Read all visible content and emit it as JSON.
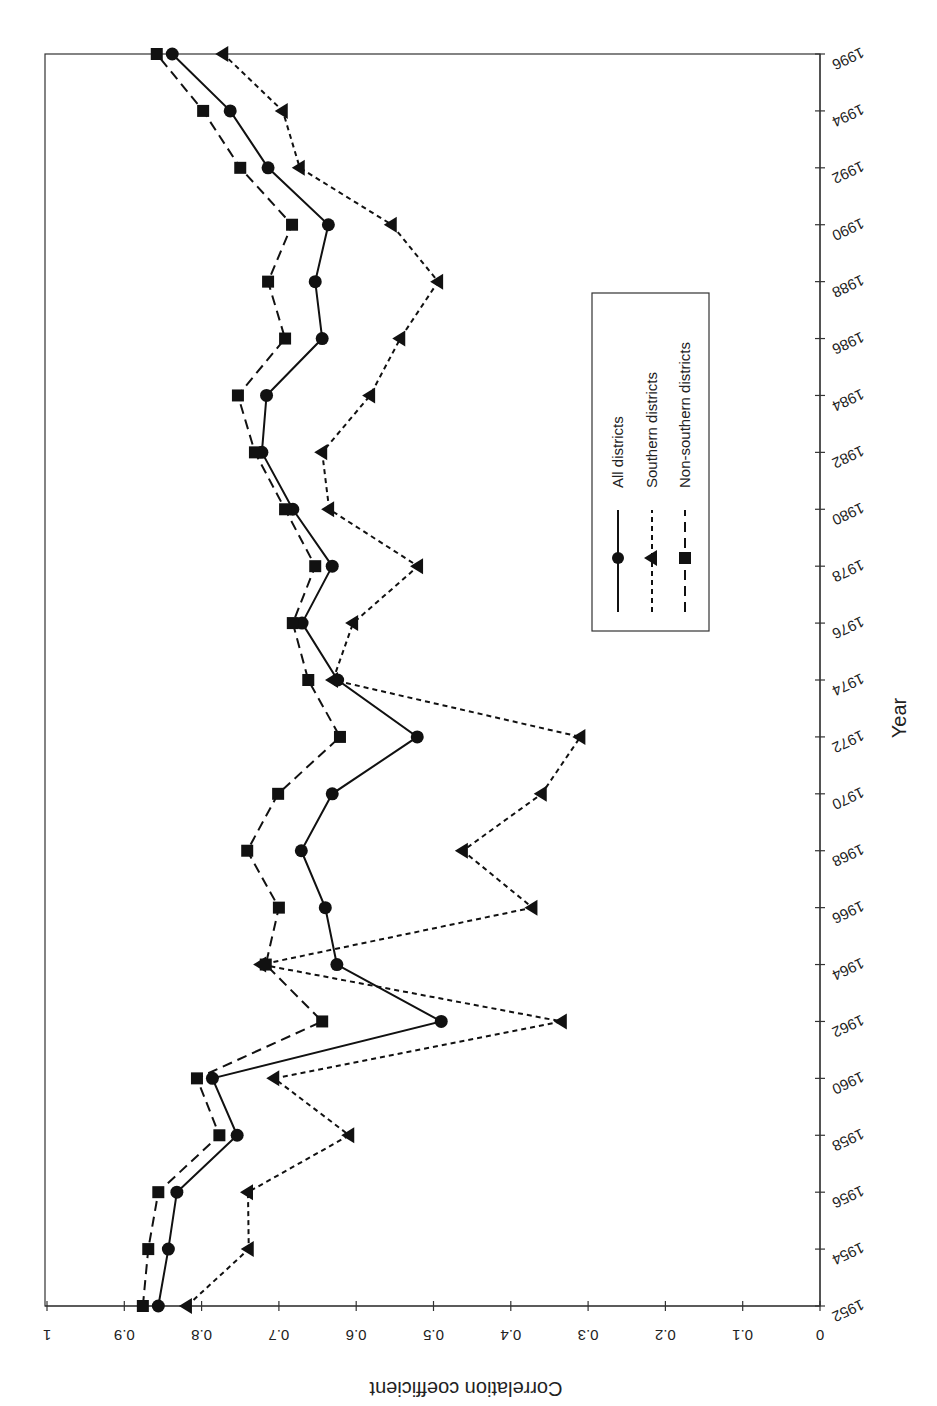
{
  "chart_data": {
    "type": "line",
    "orientation_note": "rotated 90 degrees clockwise on page",
    "title": "",
    "xlabel": "Year",
    "ylabel": "Correlation coefficient",
    "x": [
      1952,
      1954,
      1956,
      1958,
      1960,
      1962,
      1964,
      1966,
      1968,
      1970,
      1972,
      1974,
      1976,
      1978,
      1980,
      1982,
      1984,
      1986,
      1988,
      1990,
      1992,
      1994,
      1996
    ],
    "x_ticks": [
      "1952",
      "1954",
      "1956",
      "1958",
      "1960",
      "1962",
      "1964",
      "1966",
      "1968",
      "1970",
      "1972",
      "1974",
      "1976",
      "1978",
      "1980",
      "1982",
      "1984",
      "1986",
      "1988",
      "1990",
      "1992",
      "1994",
      "1996"
    ],
    "y_ticks": [
      "0",
      "0.1",
      "0.2",
      "0.3",
      "0.4",
      "0.5",
      "0.6",
      "0.7",
      "0.8",
      "0.9",
      "1"
    ],
    "ylim": [
      0,
      1
    ],
    "xlim": [
      1952,
      1996
    ],
    "grid": false,
    "legend_position": "inside, upper-right area",
    "series": [
      {
        "name": "All districts",
        "marker": "circle",
        "line": "solid",
        "values": [
          0.856,
          0.843,
          0.832,
          0.754,
          0.786,
          0.49,
          0.625,
          0.64,
          0.671,
          0.631,
          0.521,
          0.624,
          0.67,
          0.631,
          0.682,
          0.722,
          0.716,
          0.644,
          0.653,
          0.636,
          0.714,
          0.763,
          0.838
        ]
      },
      {
        "name": "Southern districts",
        "marker": "triangle",
        "line": "short-dash",
        "values": [
          0.819,
          0.739,
          0.74,
          0.609,
          0.706,
          0.334,
          0.723,
          0.372,
          0.462,
          0.36,
          0.31,
          0.63,
          0.604,
          0.52,
          0.635,
          0.644,
          0.582,
          0.543,
          0.494,
          0.554,
          0.673,
          0.695,
          0.772
        ]
      },
      {
        "name": "Non-southern districts",
        "marker": "square",
        "line": "long-dash",
        "values": [
          0.876,
          0.869,
          0.856,
          0.777,
          0.806,
          0.644,
          0.717,
          0.7,
          0.741,
          0.701,
          0.621,
          0.662,
          0.682,
          0.653,
          0.692,
          0.731,
          0.753,
          0.692,
          0.714,
          0.683,
          0.75,
          0.798,
          0.858
        ]
      }
    ]
  },
  "axes": {
    "x_title": "Year",
    "y_title": "Correlation coefficient"
  },
  "legend": {
    "items": [
      {
        "label": "All districts"
      },
      {
        "label": "Southern districts"
      },
      {
        "label": "Non-southern districts"
      }
    ]
  },
  "colors": {
    "ink": "#111111",
    "frame": "#333333"
  }
}
